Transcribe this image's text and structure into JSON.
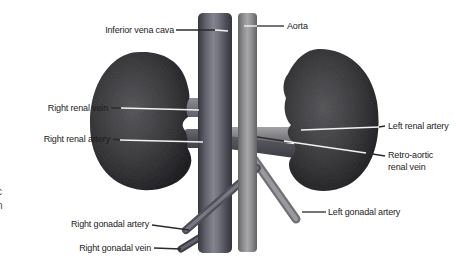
{
  "diagram": {
    "labels": {
      "inferior_vena_cava": "Inferior vena cava",
      "aorta": "Aorta",
      "right_renal_vein": "Right renal vein",
      "right_renal_artery": "Right renal artery",
      "left_renal_artery": "Left renal artery",
      "retro_aortic_renal_vein_line1": "Retro-aortic",
      "retro_aortic_renal_vein_line2": "renal vein",
      "right_gonadal_artery": "Right gonadal artery",
      "right_gonadal_vein": "Right gonadal vein",
      "left_gonadal_artery": "Left gonadal artery"
    },
    "edge_text_fragments": [
      "c",
      "n",
      "l",
      "."
    ],
    "colors": {
      "background": "#ffffff",
      "inferior_vena_cava_vessel": "#6b6c75",
      "aorta_vessel": "#a0a0a2",
      "kidney": "#3a3a3c",
      "label_text": "#1c1c1c",
      "leader_line_dark": "#2b2b2b",
      "leader_line_light": "#f2f2f2"
    }
  }
}
